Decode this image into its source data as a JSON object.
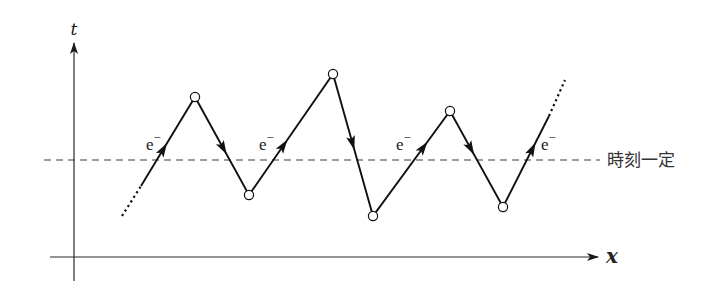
{
  "diagram": {
    "axes": {
      "t_label": "t",
      "x_label": "x",
      "origin": [
        74,
        257
      ],
      "t_axis": {
        "x": 74,
        "y_top": 43,
        "y_bottom": 281
      },
      "x_axis": {
        "y": 257,
        "x_left": 50,
        "x_right": 598
      }
    },
    "fixed_time_line": {
      "y": 160,
      "x_start": 44,
      "x_end": 600,
      "label": "時刻一定"
    },
    "electron_label": "e",
    "electron_sup": "−",
    "worldline": {
      "start_dotted": [
        [
          122,
          216
        ],
        [
          141,
          186
        ]
      ],
      "solid": [
        [
          141,
          186
        ],
        [
          195,
          97
        ],
        [
          249,
          195
        ],
        [
          333,
          74
        ],
        [
          373,
          216
        ],
        [
          450,
          111
        ],
        [
          503,
          207
        ],
        [
          549,
          116
        ]
      ],
      "end_dotted": [
        [
          549,
          116
        ],
        [
          565,
          80
        ]
      ]
    },
    "vertices": [
      {
        "x": 195,
        "y": 97
      },
      {
        "x": 249,
        "y": 195
      },
      {
        "x": 333,
        "y": 74
      },
      {
        "x": 373,
        "y": 216
      },
      {
        "x": 450,
        "y": 111
      },
      {
        "x": 503,
        "y": 207
      }
    ],
    "electron_labels": [
      {
        "x": 146,
        "y": 150
      },
      {
        "x": 259,
        "y": 150
      },
      {
        "x": 396,
        "y": 150
      },
      {
        "x": 541,
        "y": 150
      }
    ],
    "colors": {
      "line": "#111111",
      "axis": "#2a2a2a",
      "background": "#ffffff"
    }
  }
}
